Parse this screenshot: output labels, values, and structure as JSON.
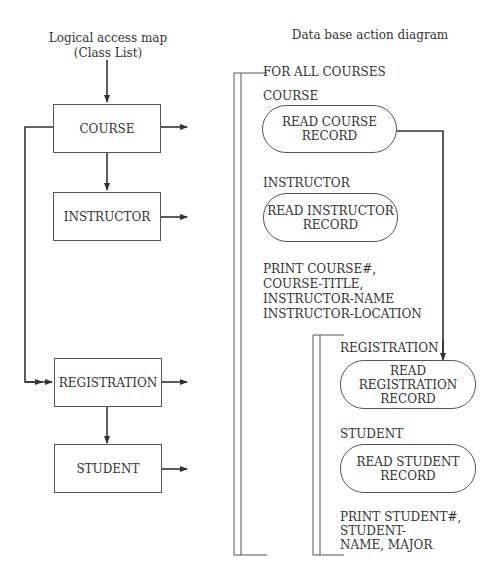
{
  "left": {
    "title_line1": "Logical access map",
    "title_line2": "(Class List)",
    "boxes": [
      {
        "id": "course",
        "label": "COURSE"
      },
      {
        "id": "instructor",
        "label": "INSTRUCTOR"
      },
      {
        "id": "registration",
        "label": "REGISTRATION"
      },
      {
        "id": "student",
        "label": "STUDENT"
      }
    ]
  },
  "right": {
    "title": "Data base action diagram",
    "outer_loop_label": "FOR ALL COURSES",
    "course_label": "COURSE",
    "course_action": "READ COURSE\nRECORD",
    "instructor_label": "INSTRUCTOR",
    "instructor_action": "READ INSTRUCTOR\nRECORD",
    "print_course": "PRINT COURSE#,\nCOURSE-TITLE,\nINSTRUCTOR-NAME\nINSTRUCTOR-LOCATION",
    "registration_label": "REGISTRATION",
    "registration_action": "READ\nREGISTRATION\nRECORD",
    "student_label": "STUDENT",
    "student_action": "READ STUDENT\nRECORD",
    "print_student": "PRINT STUDENT#,\nSTUDENT-\nNAME, MAJOR"
  }
}
